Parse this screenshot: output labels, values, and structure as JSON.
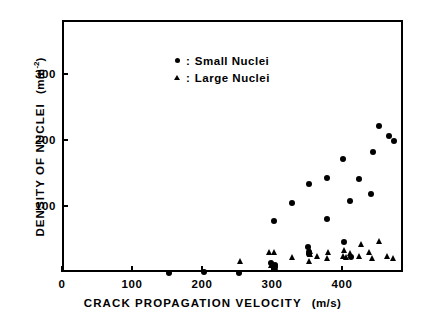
{
  "chart_data": {
    "type": "scatter",
    "title": "",
    "xlabel": "CRACK PROPAGATION VELOCITY",
    "xunit": "(m/s)",
    "ylabel": "DENSITY OF NUCLEI",
    "yunit_prefix": "(mm",
    "yunit_sup": "-2",
    "yunit_suffix": ")",
    "xlim": [
      0,
      487
    ],
    "ylim": [
      0,
      382
    ],
    "xticks": [
      0,
      100,
      200,
      300,
      400
    ],
    "yticks": [
      100,
      200,
      300
    ],
    "xticklabels": [
      "0",
      "100",
      "200",
      "300",
      "400"
    ],
    "yticklabels": [
      "100",
      "200",
      "300"
    ],
    "grid": false,
    "legend_position": "upper-left-inside",
    "legend": [
      {
        "marker": "circle",
        "separator": ":",
        "label": "Small Nuclei"
      },
      {
        "marker": "triangle",
        "separator": ":",
        "label": "Large Nuclei"
      }
    ],
    "series": [
      {
        "name": "Small Nuclei",
        "marker": "circle",
        "points": [
          [
            150,
            2
          ],
          [
            200,
            3
          ],
          [
            250,
            2
          ],
          [
            296,
            17
          ],
          [
            298,
            12
          ],
          [
            301,
            14
          ],
          [
            302,
            10
          ],
          [
            300,
            80
          ],
          [
            325,
            108
          ],
          [
            349,
            41
          ],
          [
            350,
            33
          ],
          [
            350,
            30
          ],
          [
            350,
            137
          ],
          [
            375,
            84
          ],
          [
            375,
            145
          ],
          [
            399,
            174
          ],
          [
            400,
            48
          ],
          [
            409,
            111
          ],
          [
            410,
            26
          ],
          [
            422,
            144
          ],
          [
            438,
            121
          ],
          [
            441,
            185
          ],
          [
            450,
            225
          ],
          [
            464,
            209
          ],
          [
            472,
            202
          ]
        ]
      },
      {
        "name": "Large Nuclei",
        "marker": "triangle",
        "points": [
          [
            251,
            20
          ],
          [
            293,
            33
          ],
          [
            296,
            13
          ],
          [
            300,
            33
          ],
          [
            301,
            11
          ],
          [
            325,
            26
          ],
          [
            350,
            20
          ],
          [
            351,
            30
          ],
          [
            352,
            35
          ],
          [
            362,
            27
          ],
          [
            375,
            24
          ],
          [
            377,
            33
          ],
          [
            398,
            27
          ],
          [
            400,
            36
          ],
          [
            403,
            26
          ],
          [
            409,
            32
          ],
          [
            421,
            27
          ],
          [
            424,
            46
          ],
          [
            436,
            33
          ],
          [
            440,
            24
          ],
          [
            450,
            50
          ],
          [
            461,
            27
          ],
          [
            470,
            25
          ]
        ]
      }
    ]
  },
  "colors": {
    "ink": "#000000",
    "background": "#ffffff"
  }
}
